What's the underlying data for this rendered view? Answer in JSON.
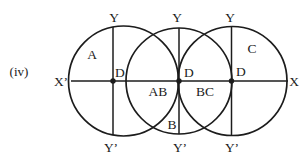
{
  "figure": {
    "item_label": "(iv)",
    "colors": {
      "ink": "#1c1c1c",
      "background": "#ffffff"
    },
    "axis_labels": {
      "x_left": "X’",
      "x_right": "X"
    },
    "vertical_axes": [
      {
        "top": "Y",
        "bottom": "Y’"
      },
      {
        "top": "Y",
        "bottom": "Y’"
      },
      {
        "top": "Y",
        "bottom": "Y’"
      }
    ],
    "centers": [
      {
        "label": "D"
      },
      {
        "label": "D"
      },
      {
        "label": "D"
      }
    ],
    "regions": {
      "a": "A",
      "b": "B",
      "c": "C",
      "ab": "AB",
      "bc": "BC"
    }
  }
}
